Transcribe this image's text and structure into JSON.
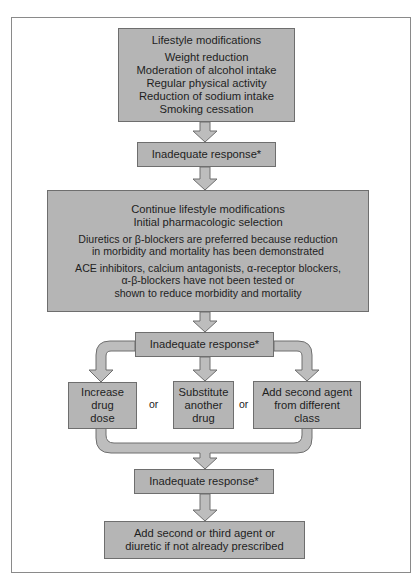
{
  "diagram": {
    "type": "flowchart",
    "colors": {
      "box_fill": "#b5b5b5",
      "box_border": "#6e6e6e",
      "arrow_fill": "#bdbdbd",
      "arrow_stroke": "#6e6e6e",
      "frame": "#8a8a8a"
    },
    "lifestyle_box": {
      "title": "Lifestyle modifications",
      "items": [
        "Weight reduction",
        "Moderation of alcohol intake",
        "Regular physical activity",
        "Reduction of sodium intake",
        "Smoking cessation"
      ]
    },
    "inadequate_1": "Inadequate response*",
    "pharmacologic_box": {
      "lines_a": [
        "Continue lifestyle modifications",
        "Initial pharmacologic selection"
      ],
      "lines_b": [
        "Diuretics or β-blockers are preferred because reduction",
        "in morbidity and mortality has been demonstrated"
      ],
      "lines_c": [
        "ACE inhibitors, calcium antagonists, α-receptor blockers,",
        "α-β-blockers have not been tested or",
        "shown to reduce morbidity and mortality"
      ]
    },
    "inadequate_2": "Inadequate response*",
    "options": [
      {
        "lines": [
          "Increase",
          "drug",
          "dose"
        ]
      },
      {
        "lines": [
          "Substitute",
          "another",
          "drug"
        ]
      },
      {
        "lines": [
          "Add second agent",
          "from different",
          "class"
        ]
      }
    ],
    "or_label_1": "or",
    "or_label_2": "or",
    "inadequate_3": "Inadequate response*",
    "final_box": {
      "lines": [
        "Add second or third agent or",
        "diuretic if not already prescribed"
      ]
    }
  }
}
